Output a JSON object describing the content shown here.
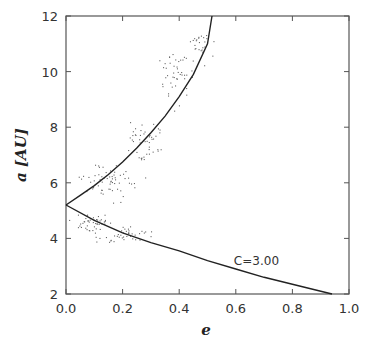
{
  "chart_data": {
    "type": "scatter",
    "title": "",
    "xlabel": "e",
    "ylabel": "a [AU]",
    "xlim": [
      0.0,
      1.0
    ],
    "ylim": [
      2,
      12
    ],
    "xticks": [
      "0.0",
      "0.2",
      "0.4",
      "0.6",
      "0.8",
      "1.0"
    ],
    "yticks": [
      "2",
      "4",
      "6",
      "8",
      "10",
      "12"
    ],
    "grid": false,
    "legend": null,
    "annotations": [
      {
        "text": "C=3.00",
        "x": 0.68,
        "y": 3.2
      }
    ],
    "series": [
      {
        "name": "C=3.00 upper curve",
        "kind": "line",
        "x": [
          0.0,
          0.05,
          0.1,
          0.15,
          0.2,
          0.25,
          0.3,
          0.35,
          0.4,
          0.45,
          0.5,
          0.516
        ],
        "y": [
          5.2,
          5.55,
          5.9,
          6.3,
          6.75,
          7.25,
          7.8,
          8.4,
          9.1,
          9.9,
          11.0,
          12.0
        ]
      },
      {
        "name": "C=3.00 lower curve",
        "kind": "line",
        "x": [
          0.0,
          0.1,
          0.2,
          0.3,
          0.4,
          0.5,
          0.6,
          0.7,
          0.8,
          0.94
        ],
        "y": [
          5.2,
          4.65,
          4.2,
          3.85,
          3.55,
          3.2,
          2.9,
          2.6,
          2.35,
          2.0
        ]
      },
      {
        "name": "particles",
        "kind": "scatter",
        "clusters": [
          {
            "cx": 0.47,
            "cy": 11.0,
            "spread_x": 0.03,
            "spread_y": 0.6,
            "n": 25
          },
          {
            "cx": 0.39,
            "cy": 9.8,
            "spread_x": 0.04,
            "spread_y": 0.7,
            "n": 45
          },
          {
            "cx": 0.28,
            "cy": 7.5,
            "spread_x": 0.05,
            "spread_y": 0.5,
            "n": 45
          },
          {
            "cx": 0.15,
            "cy": 6.0,
            "spread_x": 0.08,
            "spread_y": 0.5,
            "n": 60
          },
          {
            "cx": 0.08,
            "cy": 4.6,
            "spread_x": 0.06,
            "spread_y": 0.3,
            "n": 45
          },
          {
            "cx": 0.22,
            "cy": 4.1,
            "spread_x": 0.08,
            "spread_y": 0.25,
            "n": 40
          }
        ]
      }
    ]
  }
}
